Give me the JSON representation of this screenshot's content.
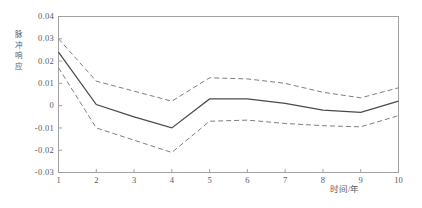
{
  "chart_data": {
    "type": "line",
    "title": "",
    "xlabel": "时间/年",
    "ylabel": "脉冲响应",
    "x": [
      1,
      2,
      3,
      4,
      5,
      6,
      7,
      8,
      9,
      10
    ],
    "xlim": [
      1,
      10
    ],
    "ylim": [
      -0.03,
      0.04
    ],
    "grid": false,
    "legend": "none",
    "xticks": [
      "1",
      "2",
      "3",
      "4",
      "5",
      "6",
      "7",
      "8",
      "9",
      "10"
    ],
    "yticks": [
      "0.04",
      "0.03",
      "0.02",
      "0.01",
      "0",
      "-0.01",
      "-0.02",
      "-0.03"
    ],
    "ytick_values": [
      0.04,
      0.03,
      0.02,
      0.01,
      0,
      -0.01,
      -0.02,
      -0.03
    ],
    "series": [
      {
        "name": "脉冲响应",
        "style": "solid",
        "color": "#4a4a4a",
        "values": [
          0.024,
          0.0005,
          -0.005,
          -0.01,
          0.003,
          0.003,
          0.001,
          -0.002,
          -0.003,
          0.002
        ]
      },
      {
        "name": "置信区间上界",
        "style": "dashed",
        "color": "#777777",
        "values": [
          0.03,
          0.011,
          0.0065,
          0.002,
          0.0125,
          0.012,
          0.01,
          0.006,
          0.0035,
          0.008
        ]
      },
      {
        "name": "置信区间下界",
        "style": "dashed",
        "color": "#777777",
        "values": [
          0.017,
          -0.01,
          -0.0155,
          -0.021,
          -0.007,
          -0.0065,
          -0.008,
          -0.009,
          -0.0095,
          -0.0045
        ]
      }
    ]
  },
  "axes": {
    "frame_color": "#999999",
    "tick_color": "#999999",
    "text_color": "#5a5a5a"
  }
}
